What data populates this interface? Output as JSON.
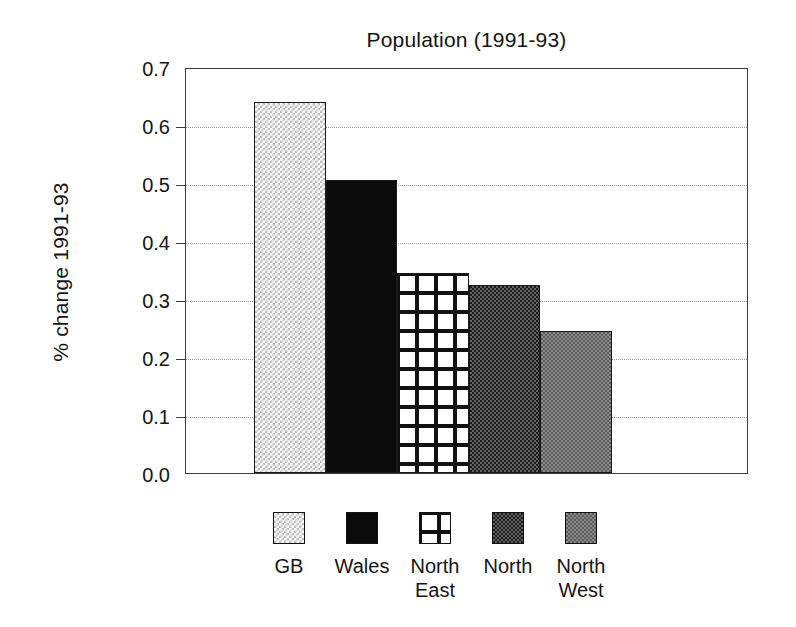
{
  "chart_data": {
    "type": "bar",
    "title": "Population (1991-93)",
    "xlabel": "",
    "ylabel": "% change 1991-93",
    "categories": [
      "GB",
      "Wales",
      "North East",
      "North",
      "North West"
    ],
    "values": [
      0.64,
      0.505,
      0.345,
      0.325,
      0.245
    ],
    "ylim": [
      0.0,
      0.7
    ],
    "ytick_labels": [
      "0.7",
      "0.6",
      "0.5",
      "0.4",
      "0.3",
      "0.2",
      "0.1",
      "0.0"
    ],
    "ytick_values": [
      0.7,
      0.6,
      0.5,
      0.4,
      0.3,
      0.2,
      0.1,
      0.0
    ],
    "grid": true,
    "grid_style": "dotted-horizontal",
    "legend_position": "bottom",
    "legend": [
      {
        "label_line1": "GB",
        "label_line2": "",
        "pattern": "light-checker"
      },
      {
        "label_line1": "Wales",
        "label_line2": "",
        "pattern": "solid-black"
      },
      {
        "label_line1": "North",
        "label_line2": "East",
        "pattern": "open-grid"
      },
      {
        "label_line1": "North",
        "label_line2": "",
        "pattern": "dark-checker"
      },
      {
        "label_line1": "North",
        "label_line2": "West",
        "pattern": "mid-checker"
      }
    ]
  },
  "colors": {
    "axis": "#3b3b3b",
    "grid": "#9a9a9a",
    "text": "#141414",
    "background": "#ffffff"
  }
}
